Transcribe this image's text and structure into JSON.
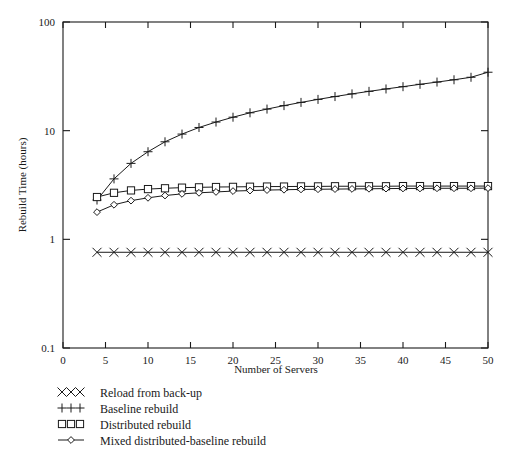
{
  "chart_data": {
    "type": "line",
    "title": "",
    "xlabel": "Number of Servers",
    "ylabel": "Rebuild Time (hours)",
    "xlim": [
      0,
      50
    ],
    "ylim": [
      0.1,
      100
    ],
    "yscale": "log",
    "xscale": "linear",
    "grid": false,
    "legend_position": "below-left",
    "xticks": [
      0,
      5,
      10,
      15,
      20,
      25,
      30,
      35,
      40,
      45,
      50
    ],
    "xtick_labels": [
      "0",
      "5",
      "10",
      "15",
      "20",
      "25",
      "30",
      "35",
      "40",
      "45",
      "50"
    ],
    "yticks": [
      0.1,
      1,
      10,
      100
    ],
    "ytick_labels": [
      "0.1",
      "1",
      "10",
      "100"
    ],
    "x": [
      4,
      6,
      8,
      10,
      12,
      14,
      16,
      18,
      20,
      22,
      24,
      26,
      28,
      30,
      32,
      34,
      36,
      38,
      40,
      42,
      44,
      46,
      48,
      50
    ],
    "series": [
      {
        "name": "Reload from back-up",
        "marker": "x",
        "values": [
          0.76,
          0.76,
          0.76,
          0.76,
          0.76,
          0.76,
          0.76,
          0.76,
          0.76,
          0.76,
          0.76,
          0.76,
          0.76,
          0.76,
          0.76,
          0.76,
          0.76,
          0.76,
          0.76,
          0.76,
          0.76,
          0.76,
          0.76,
          0.76
        ]
      },
      {
        "name": "Baseline rebuild",
        "marker": "plus",
        "values": [
          2.3,
          3.6,
          5.0,
          6.4,
          7.9,
          9.3,
          10.7,
          12.0,
          13.3,
          14.6,
          15.8,
          17.0,
          18.2,
          19.4,
          20.6,
          21.8,
          23.0,
          24.2,
          25.4,
          26.7,
          28.0,
          29.4,
          31.0,
          34.5
        ]
      },
      {
        "name": "Distributed rebuild",
        "marker": "square",
        "values": [
          2.45,
          2.68,
          2.82,
          2.9,
          2.95,
          2.99,
          3.01,
          3.03,
          3.04,
          3.05,
          3.06,
          3.06,
          3.07,
          3.07,
          3.08,
          3.08,
          3.08,
          3.08,
          3.09,
          3.09,
          3.09,
          3.09,
          3.09,
          3.09
        ]
      },
      {
        "name": "Mixed distributed-baseline rebuild",
        "marker": "diamond",
        "values": [
          1.78,
          2.08,
          2.27,
          2.41,
          2.53,
          2.62,
          2.68,
          2.73,
          2.78,
          2.81,
          2.84,
          2.86,
          2.88,
          2.89,
          2.9,
          2.91,
          2.92,
          2.93,
          2.94,
          2.94,
          2.95,
          2.95,
          2.95,
          2.96
        ]
      }
    ]
  },
  "legend": {
    "items": [
      {
        "label": "Reload from back-up",
        "marker": "x"
      },
      {
        "label": "Baseline rebuild",
        "marker": "plus"
      },
      {
        "label": "Distributed rebuild",
        "marker": "square"
      },
      {
        "label": "Mixed distributed-baseline rebuild",
        "marker": "diamond"
      }
    ]
  },
  "colors": {
    "ink": "#1a1a1a",
    "background": "#ffffff"
  }
}
